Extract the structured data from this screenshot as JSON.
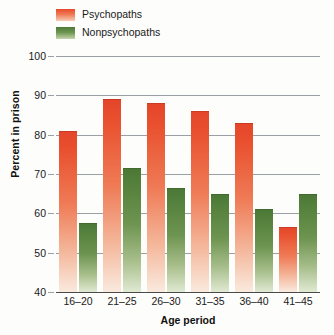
{
  "chart_data": {
    "type": "bar",
    "title": "",
    "xlabel": "Age period",
    "ylabel": "Percent in prison",
    "categories": [
      "16–20",
      "21–25",
      "26–30",
      "31–35",
      "36–40",
      "41–45"
    ],
    "series": [
      {
        "name": "Psychopaths",
        "color": "#e8492b",
        "values": [
          81,
          89,
          88,
          86,
          83,
          56.5
        ]
      },
      {
        "name": "Nonpsychopaths",
        "color": "#4d7a38",
        "values": [
          57.5,
          71.5,
          66.5,
          65,
          61,
          65
        ]
      }
    ],
    "ylim": [
      40,
      100
    ],
    "yticks": [
      100,
      90,
      80,
      70,
      60,
      50,
      40
    ],
    "grid": true,
    "legend_position": "top-left"
  },
  "legend": {
    "items": [
      {
        "label": "Psychopaths",
        "swatch": "red"
      },
      {
        "label": "Nonpsychopaths",
        "swatch": "green"
      }
    ]
  }
}
